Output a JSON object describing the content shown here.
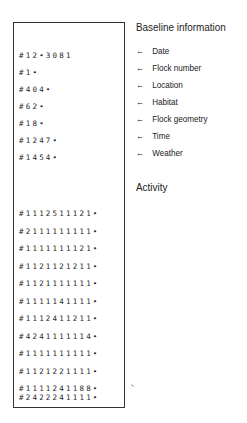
{
  "baseline": {
    "heading": "Baseline information",
    "records": [
      {
        "value": "#12•3081",
        "field": "Date"
      },
      {
        "value": "#1•",
        "field": "Flock number"
      },
      {
        "value": "#404•",
        "field": "Location"
      },
      {
        "value": "#62•",
        "field": "Habitat"
      },
      {
        "value": "#18•",
        "field": "Flock geometry"
      },
      {
        "value": "#1247•",
        "field": "Time"
      },
      {
        "value": "#1454•",
        "field": "Weather"
      }
    ],
    "arrow_icon": "←"
  },
  "activity": {
    "heading": "Activity",
    "records": [
      "#1112511121•",
      "#2111111111•",
      "#1111111121•",
      "#1121121211•",
      "#1121111111•",
      "#1111141111•",
      "#1112411211•",
      "#4241111114•",
      "#1111111111•",
      "#1121221111•",
      "#1111241188•",
      "#2422241111•"
    ]
  }
}
